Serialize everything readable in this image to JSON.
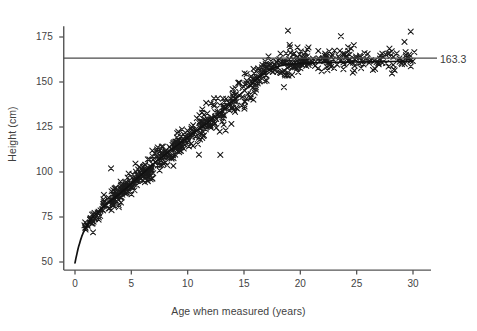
{
  "chart_data": {
    "type": "scatter",
    "title": "",
    "xlabel": "Age when measured (years)",
    "ylabel": "Height (cm)",
    "xlim": [
      -1.8,
      32.5
    ],
    "ylim": [
      44,
      182
    ],
    "xticks": [
      0,
      5,
      10,
      15,
      20,
      25,
      30
    ],
    "xtick_labels": [
      "0",
      "5",
      "10",
      "15",
      "20",
      "25",
      "30"
    ],
    "yticks": [
      50,
      75,
      100,
      125,
      150,
      175
    ],
    "ytick_labels": [
      "50",
      "75",
      "100",
      "125",
      "150",
      "175"
    ],
    "grid": false,
    "legend": "none",
    "marker": "x",
    "marker_color": "#1a1a1a",
    "annotations": [
      {
        "name": "adult-height-reference",
        "label": "163.3",
        "type": "horizontal-line",
        "y": 163.3,
        "color": "#4a4a4a"
      }
    ],
    "series": [
      {
        "name": "fitted-growth-curve",
        "type": "line",
        "color": "#111111",
        "x": [
          0.0,
          0.08,
          0.17,
          0.25,
          0.33,
          0.42,
          0.5,
          0.6,
          0.75,
          0.9,
          1.1,
          1.3,
          1.5,
          1.8,
          2.1,
          2.5,
          3.0,
          3.5,
          4.0,
          4.5,
          5.0,
          5.5,
          6.0,
          6.5,
          7.0,
          7.5,
          8.0,
          8.5,
          9.0,
          9.5,
          10.0,
          10.5,
          11.0,
          11.5,
          12.0,
          12.5,
          13.0,
          13.5,
          14.0,
          14.5,
          15.0,
          15.5,
          16.0,
          16.5,
          17.0,
          17.5,
          18.0,
          18.5,
          19.0,
          20.0,
          21.0,
          22.0,
          23.0,
          24.0,
          25.0,
          26.0,
          27.0,
          28.0,
          29.0,
          30.0
        ],
        "y": [
          49.5,
          52.0,
          54.5,
          56.8,
          58.8,
          60.6,
          62.3,
          64.2,
          66.5,
          68.4,
          70.6,
          72.5,
          74.2,
          76.4,
          78.3,
          80.6,
          83.3,
          85.7,
          88.2,
          90.8,
          93.5,
          96.3,
          99.1,
          101.9,
          104.6,
          107.2,
          109.7,
          112.1,
          114.5,
          116.9,
          119.2,
          121.5,
          123.8,
          126.1,
          128.5,
          131.0,
          133.6,
          136.3,
          139.1,
          142.0,
          145.0,
          148.0,
          150.9,
          153.5,
          155.7,
          157.4,
          158.6,
          159.4,
          159.9,
          160.4,
          160.6,
          160.8,
          160.9,
          161.0,
          161.1,
          161.2,
          161.3,
          161.4,
          161.5,
          161.6
        ]
      },
      {
        "name": "height-measurements",
        "type": "scatter",
        "description": "Individual height measurements by age; ~700 points, marker = x",
        "n_points": 700,
        "x_range": [
          0.8,
          30.2
        ],
        "y_range": [
          66,
          179
        ]
      }
    ]
  },
  "axes": {
    "y_axis_name": "height-axis",
    "x_axis_name": "age-axis"
  },
  "figure": {
    "background": "#ffffff",
    "axis_color": "#555555"
  }
}
